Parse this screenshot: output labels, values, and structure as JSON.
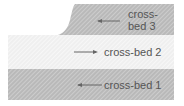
{
  "diagram": {
    "colors": {
      "dark_bed": "#b4b4b4",
      "dark_stripe": "#d2d2d2",
      "light_bed": "#ececec",
      "light_stripe": "#fafafa",
      "text": "#555555",
      "arrow": "#666666"
    },
    "beds": [
      {
        "id": "cross-bed-1",
        "label": "cross-bed 1",
        "arrow_direction": "left",
        "shade": "dark"
      },
      {
        "id": "cross-bed-2",
        "label": "cross-bed 2",
        "arrow_direction": "right",
        "shade": "light"
      },
      {
        "id": "cross-bed-3",
        "label_line1": "cross-",
        "label_line2": "bed 3",
        "arrow_direction": "left",
        "shade": "dark"
      }
    ]
  }
}
